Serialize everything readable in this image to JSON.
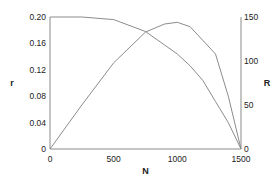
{
  "chart_data": {
    "type": "line",
    "title": "",
    "xlabel": "N",
    "ylabel": "r",
    "y2label": "R",
    "xlim": [
      0,
      1500
    ],
    "ylim": [
      0,
      0.2
    ],
    "y2lim": [
      0,
      150
    ],
    "xticks": [
      "0",
      "500",
      "1000",
      "1500"
    ],
    "xtick_values": [
      0,
      500,
      1000,
      1500
    ],
    "yticks": [
      "0",
      "0.04",
      "0.08",
      "0.12",
      "0.16",
      "0.20"
    ],
    "ytick_values": [
      0,
      0.04,
      0.08,
      0.12,
      0.16,
      0.2
    ],
    "y2ticks": [
      "0",
      "50",
      "100",
      "150"
    ],
    "y2tick_values": [
      0,
      50,
      100,
      150
    ],
    "grid": false,
    "legend": "none",
    "series": [
      {
        "name": "r",
        "axis": "left",
        "x": [
          0,
          250,
          500,
          750,
          1000,
          1100,
          1200,
          1300,
          1400,
          1500
        ],
        "values": [
          0.2,
          0.2,
          0.196,
          0.178,
          0.144,
          0.126,
          0.104,
          0.072,
          0.04,
          0
        ]
      },
      {
        "name": "R",
        "axis": "right",
        "x": [
          0,
          250,
          500,
          750,
          900,
          1000,
          1100,
          1300,
          1400,
          1500
        ],
        "values": [
          0,
          50,
          98,
          133,
          142,
          144,
          139,
          108,
          60,
          0
        ]
      }
    ]
  }
}
